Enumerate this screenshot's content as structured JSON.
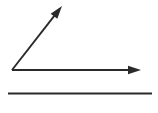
{
  "canvas": {
    "width": 158,
    "height": 113,
    "background_color": "#ffffff",
    "title": "Angle figure with two rays and a separate line segment"
  },
  "style": {
    "stroke_color": "#2a2a2a",
    "stroke_width": 1.9,
    "fill_color": "#2a2a2a"
  },
  "figure": {
    "type": "geometric-line-drawing",
    "vertex": {
      "label": "",
      "x": 12,
      "y": 70
    },
    "elements": [
      {
        "name": "diagonal-ray",
        "kind": "ray",
        "from": {
          "x": 12,
          "y": 70
        },
        "to": {
          "x": 62,
          "y": 6
        },
        "arrow_at": "end",
        "angle_degrees": 52,
        "length_px": 81
      },
      {
        "name": "horizontal-ray",
        "kind": "ray",
        "from": {
          "x": 12,
          "y": 70
        },
        "to": {
          "x": 141,
          "y": 70
        },
        "arrow_at": "end",
        "angle_degrees": 0,
        "length_px": 129
      },
      {
        "name": "bottom-line-segment",
        "kind": "segment",
        "from": {
          "x": 8,
          "y": 93.5
        },
        "to": {
          "x": 152,
          "y": 93.5
        },
        "arrow_at": "none",
        "angle_degrees": 0,
        "length_px": 144
      }
    ],
    "arrowhead": {
      "shape": "filled-triangle",
      "length_px": 13,
      "half_width_px": 4.2
    }
  }
}
